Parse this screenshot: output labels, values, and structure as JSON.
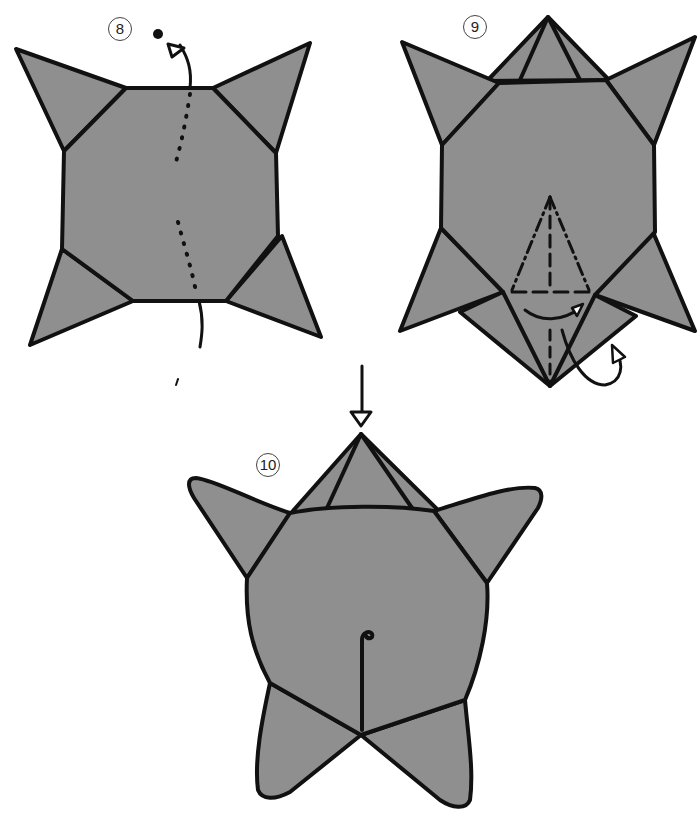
{
  "diagram": {
    "type": "origami-instructions",
    "colors": {
      "paper": "#8f8f8f",
      "outline": "#111111",
      "background": "#ffffff"
    },
    "steps": [
      {
        "label": "8",
        "description": "octagon body with four corner flaps; dotted valley line down center; arrow indicates turning over"
      },
      {
        "label": "9",
        "description": "body with head flap on top; mountain/valley fold lines at bottom forming tail; arrows indicate folding"
      },
      {
        "label": "10",
        "description": "finished turtle shape with head, four legs; push-arrow at top"
      }
    ]
  }
}
